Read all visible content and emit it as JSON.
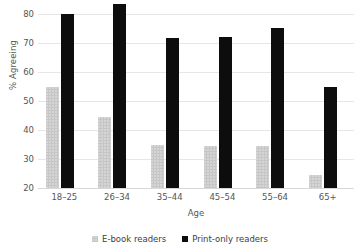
{
  "chart_data": {
    "type": "bar",
    "title": "",
    "xlabel": "Age",
    "ylabel": "% Agreeing",
    "ylim": [
      20,
      80
    ],
    "yticks": [
      80,
      70,
      60,
      50,
      40,
      30,
      20
    ],
    "grid": true,
    "legend_position": "bottom",
    "categories": [
      "18–25",
      "26–34",
      "35–44",
      "45–54",
      "55–64",
      "65+"
    ],
    "series": [
      {
        "name": "E-book readers",
        "color": "#c6c6c6",
        "values": [
          55,
          44.5,
          35,
          34.5,
          34.5,
          24.5
        ]
      },
      {
        "name": "Print-only readers",
        "color": "#0d0d0d",
        "values": [
          80,
          83.5,
          71.8,
          72.2,
          75.3,
          54.7
        ]
      }
    ]
  },
  "legend": {
    "items": [
      {
        "label": "E-book readers",
        "swatch": "ebook"
      },
      {
        "label": "Print-only readers",
        "swatch": "print"
      }
    ]
  }
}
